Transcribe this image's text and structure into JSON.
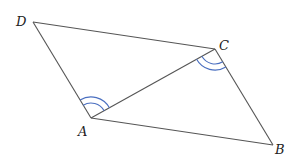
{
  "diagram": {
    "type": "parallelogram-with-diagonal",
    "vertices": [
      {
        "id": "A",
        "label": "A",
        "x": 91,
        "y": 118,
        "lx": 78,
        "ly": 136
      },
      {
        "id": "B",
        "label": "B",
        "x": 273,
        "y": 145,
        "lx": 275,
        "ly": 154
      },
      {
        "id": "C",
        "label": "C",
        "x": 215,
        "y": 49,
        "lx": 219,
        "ly": 50
      },
      {
        "id": "D",
        "label": "D",
        "x": 33,
        "y": 22,
        "lx": 16,
        "ly": 26
      }
    ],
    "edges": [
      {
        "from": "D",
        "to": "C"
      },
      {
        "from": "C",
        "to": "B"
      },
      {
        "from": "B",
        "to": "A"
      },
      {
        "from": "A",
        "to": "D"
      },
      {
        "from": "A",
        "to": "C"
      }
    ],
    "angle_marks": [
      {
        "vertex": "A",
        "between": [
          "D",
          "C"
        ],
        "arcs": 2,
        "color": "#4a6fc0"
      },
      {
        "vertex": "C",
        "between": [
          "A",
          "B"
        ],
        "arcs": 2,
        "color": "#4a6fc0"
      }
    ],
    "colors": {
      "edge": "#555555",
      "arc": "#4a6fc0",
      "label": "#222222"
    }
  }
}
